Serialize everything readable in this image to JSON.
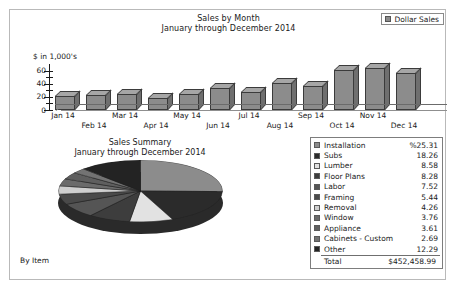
{
  "report": {
    "by_item_label": "By Item"
  },
  "bar_chart": {
    "title": "Sales by Month",
    "subtitle": "January through December 2014",
    "axis_caption": "$ in 1,000's",
    "legend": {
      "label": "Dollar Sales",
      "swatch_color": "#8c8c8c"
    }
  },
  "pie_chart": {
    "title": "Sales Summary",
    "subtitle": "January through December 2014"
  },
  "table": {
    "percent_prefix": "%",
    "total_label": "Total",
    "total_value": "$452,458.99",
    "rows": [
      {
        "label": "Installation",
        "value": "%25.31",
        "color": "#8c8c8c"
      },
      {
        "label": "Subs",
        "value": "18.26",
        "color": "#2b2b2b"
      },
      {
        "label": "Lumber",
        "value": "8.58",
        "color": "#e2e2e2"
      },
      {
        "label": "Floor Plans",
        "value": "8.28",
        "color": "#3d3d3d"
      },
      {
        "label": "Labor",
        "value": "7.52",
        "color": "#555555"
      },
      {
        "label": "Framing",
        "value": "5.44",
        "color": "#4a4a4a"
      },
      {
        "label": "Removal",
        "value": "4.26",
        "color": "#cfcfcf"
      },
      {
        "label": "Window",
        "value": "3.76",
        "color": "#6b6b6b"
      },
      {
        "label": "Appliance",
        "value": "3.61",
        "color": "#5f5f5f"
      },
      {
        "label": "Cabinets - Custom",
        "value": "2.69",
        "color": "#737373"
      },
      {
        "label": "Other",
        "value": "12.29",
        "color": "#232323"
      }
    ]
  },
  "chart_data": [
    {
      "type": "bar",
      "title": "Sales by Month",
      "subtitle": "January through December 2014",
      "xlabel": "",
      "ylabel": "$ in 1,000's",
      "ylim": [
        0,
        70
      ],
      "yticks": [
        0,
        20,
        40,
        60
      ],
      "grid": false,
      "legend": [
        "Dollar Sales"
      ],
      "legend_position": "top-right",
      "categories": [
        "Jan 14",
        "Feb 14",
        "Mar 14",
        "Apr 14",
        "May 14",
        "Jun 14",
        "Jul 14",
        "Aug 14",
        "Sep 14",
        "Oct 14",
        "Nov 14",
        "Dec 14"
      ],
      "values": [
        21,
        23,
        25,
        18,
        25,
        33,
        27,
        41,
        37,
        61,
        64,
        57
      ]
    },
    {
      "type": "pie",
      "title": "Sales Summary",
      "subtitle": "January through December 2014",
      "labels": [
        "Installation",
        "Subs",
        "Lumber",
        "Floor Plans",
        "Labor",
        "Framing",
        "Removal",
        "Window",
        "Appliance",
        "Cabinets - Custom",
        "Other"
      ],
      "values": [
        25.31,
        18.26,
        8.58,
        8.28,
        7.52,
        5.44,
        4.26,
        3.76,
        3.61,
        2.69,
        12.29
      ],
      "unit": "percent",
      "total": "$452,458.99",
      "legend_position": "right"
    }
  ]
}
